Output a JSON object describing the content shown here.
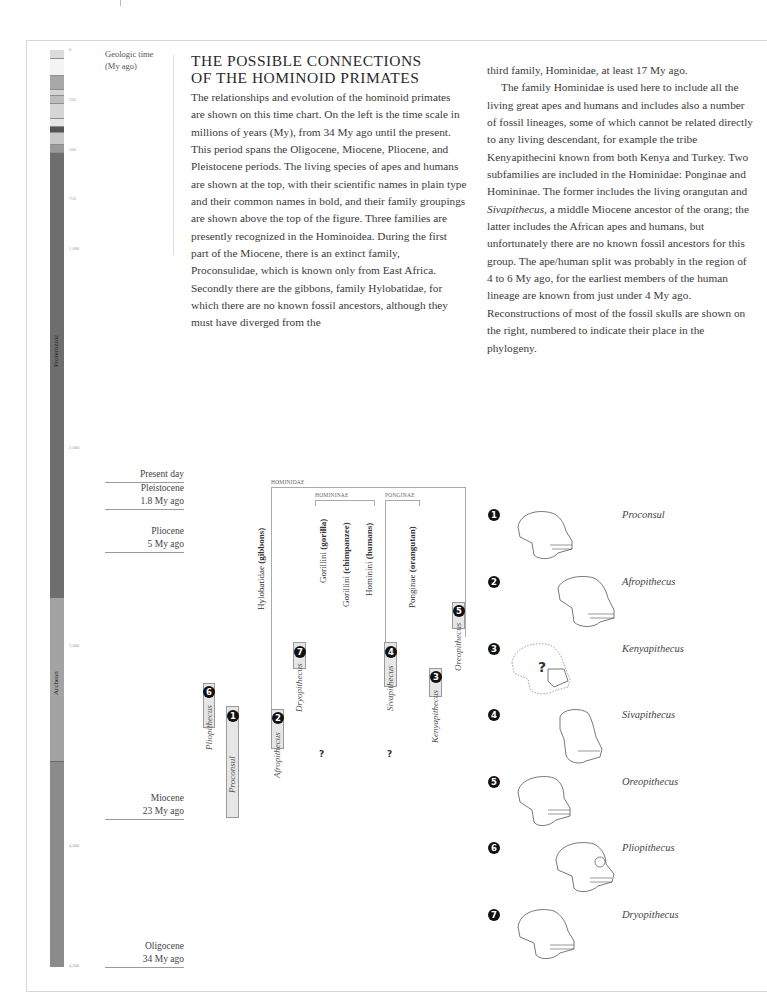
{
  "timescale": {
    "title_line1": "Geologic time",
    "title_line2": "(My ago)",
    "ticks": [
      "0",
      "250",
      "500",
      "750",
      "1,000",
      "2,000",
      "3,000",
      "4,000",
      "4,600"
    ],
    "eons": [
      "Proterozoic",
      "Archean"
    ]
  },
  "article": {
    "heading_line1": "THE POSSIBLE CONNECTIONS",
    "heading_line2": "OF THE HOMINOID PRIMATES",
    "col1": "The relationships and evolution of the hominoid primates are shown on this time chart. On the left is the time scale in millions of years (My), from 34 My ago until the present. This period spans the Oligocene, Miocene, Pliocene, and Pleistocene periods. The living species of apes and humans are shown at the top, with their scientific names in plain type and their common names in bold, and their family groupings are shown above the top of the figure. Three families are presently recognized in the Hominoidea. During the first part of the Miocene, there is an extinct family, Proconsulidae, which is known only from East Africa. Secondly there are the gibbons, family Hylobatidae, for which there are no known fossil ancestors, although they must have diverged from the",
    "col2_p1": "third family, Hominidae, at least 17 My ago.",
    "col2_p2_a": "The family Hominidae is used here to include all the living great apes and humans and includes also a number of fossil lineages, some of which cannot be related directly to any living descendant, for example the tribe Kenyapithecini known from both Kenya and Turkey. Two subfamilies are included in the Hominidae: Ponginae and Homininae. The former includes the living orangutan and ",
    "col2_p2_ital": "Sivapithecus",
    "col2_p2_b": ", a middle Miocene ancestor of the orang; the latter includes the African apes and humans, but unfortunately there are no known fossil ancestors for this group. The ape/human split was probably in the region of 4 to 6 My ago, for the earliest members of the human lineage are known from just under 4 My ago. Reconstructions of most of the fossil skulls are shown on the right, numbered to indicate their place in the phylogeny."
  },
  "epochs": [
    {
      "name": "Present day",
      "age": ""
    },
    {
      "name": "Pleistocene",
      "age": "1.8 My ago"
    },
    {
      "name": "Pliocene",
      "age": "5 My ago"
    },
    {
      "name": "Miocene",
      "age": "23 My ago"
    },
    {
      "name": "Oligocene",
      "age": "34 My ago"
    }
  ],
  "groups": {
    "hominidae": "HOMINIDAE",
    "homininae": "HOMININAE",
    "ponginae": "PONGINAE"
  },
  "living_taxa": [
    {
      "sci": "Hylobatidae",
      "common": "(gibbons)"
    },
    {
      "sci": "Gorillini",
      "common": "(gorilla)"
    },
    {
      "sci": "Gorillini",
      "common": "(chimpanzee)"
    },
    {
      "sci": "Hominini",
      "common": "(humans)"
    },
    {
      "sci": "Ponginae",
      "common": "(orangutan)"
    }
  ],
  "fossils": [
    {
      "num": "1",
      "name": "Proconsul"
    },
    {
      "num": "2",
      "name": "Afropithecus"
    },
    {
      "num": "3",
      "name": "Kenyapithecus"
    },
    {
      "num": "4",
      "name": "Sivapithecus"
    },
    {
      "num": "5",
      "name": "Oreopithecus"
    },
    {
      "num": "6",
      "name": "Pliopithecus"
    },
    {
      "num": "7",
      "name": "Dryopithecus"
    }
  ],
  "unknown_marker": "?",
  "skull_question": "?"
}
